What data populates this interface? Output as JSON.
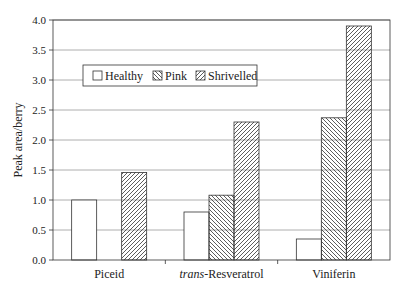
{
  "chart_data": {
    "type": "bar",
    "title": "",
    "xlabel": "",
    "ylabel": "Peak area/berry",
    "ylim": [
      0,
      4.0
    ],
    "yticks": [
      "0.0",
      "0.5",
      "1.0",
      "1.5",
      "2.0",
      "2.5",
      "3.0",
      "3.5",
      "4.0"
    ],
    "grid": true,
    "legend_position": "upper-left inside",
    "categories": [
      "Piceid",
      "trans-Resveratrol",
      "Viniferin"
    ],
    "category_display": [
      {
        "italic": "",
        "normal": "Piceid"
      },
      {
        "italic": "trans",
        "normal": "-Resveratrol"
      },
      {
        "italic": "",
        "normal": "Viniferin"
      }
    ],
    "series": [
      {
        "name": "Healthy",
        "pattern": "empty",
        "values": [
          1.0,
          0.8,
          0.35
        ]
      },
      {
        "name": "Pink",
        "pattern": "backslash-hatch",
        "values": [
          null,
          1.08,
          2.37
        ]
      },
      {
        "name": "Shrivelled",
        "pattern": "slash-hatch",
        "values": [
          1.46,
          2.3,
          3.9
        ]
      }
    ]
  },
  "colors": {
    "axis": "#333333",
    "grid": "#9a9a9a",
    "bar_edge": "#333333",
    "bar_fill": "#ffffff"
  }
}
